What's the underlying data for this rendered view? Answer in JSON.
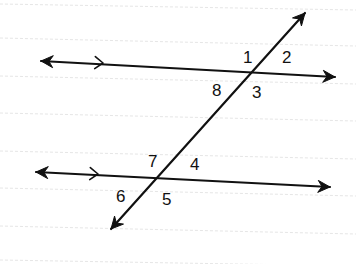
{
  "diagram": {
    "type": "parallel-lines-cut-by-transversal",
    "colors": {
      "stroke": "#111111",
      "background": "#ffffff",
      "ruled_lines": "#e6e6e6"
    },
    "ruled_lines_y": [
      [
        0,
        4,
        356,
        10
      ],
      [
        0,
        38,
        356,
        46
      ],
      [
        0,
        76,
        356,
        84
      ],
      [
        0,
        113,
        356,
        121
      ],
      [
        0,
        151,
        356,
        159
      ],
      [
        0,
        188,
        356,
        196
      ],
      [
        0,
        226,
        356,
        234
      ],
      [
        0,
        260,
        356,
        266
      ]
    ],
    "lines": [
      {
        "id": "top-parallel-line",
        "start": [
          41,
          61
        ],
        "end": [
          335,
          77
        ],
        "arrows": "both",
        "parallel_mark": [
          103,
          63
        ]
      },
      {
        "id": "bottom-parallel-line",
        "start": [
          36,
          172
        ],
        "end": [
          330,
          187
        ],
        "arrows": "both",
        "parallel_mark": [
          98,
          174
        ]
      },
      {
        "id": "transversal",
        "start": [
          111,
          229
        ],
        "end": [
          305,
          13
        ],
        "arrows": "both"
      }
    ],
    "intersections": [
      {
        "id": "top",
        "point": [
          254,
          71
        ]
      },
      {
        "id": "bottom",
        "point": [
          157,
          179
        ]
      }
    ],
    "angle_labels": [
      {
        "text": "1",
        "x": 243,
        "y": 63
      },
      {
        "text": "2",
        "x": 282,
        "y": 63
      },
      {
        "text": "8",
        "x": 212,
        "y": 96
      },
      {
        "text": "3",
        "x": 252,
        "y": 98
      },
      {
        "text": "7",
        "x": 148,
        "y": 167
      },
      {
        "text": "4",
        "x": 190,
        "y": 170
      },
      {
        "text": "6",
        "x": 116,
        "y": 202
      },
      {
        "text": "5",
        "x": 162,
        "y": 205
      }
    ]
  }
}
